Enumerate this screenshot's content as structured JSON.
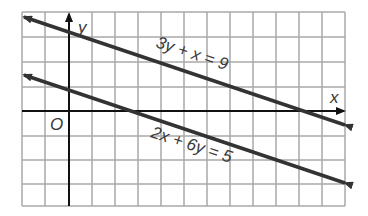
{
  "graph": {
    "type": "coordinate-plane",
    "axis_labels": {
      "x": "x",
      "y": "y",
      "origin": "O"
    },
    "grid": {
      "x_min": -2,
      "x_max": 12,
      "y_min": -4,
      "y_max": 4,
      "cell_px": 23.3
    },
    "lines": [
      {
        "equation": "3y + x = 9",
        "slope": -0.3333,
        "y_intercept": 3
      },
      {
        "equation": "2x + 6y = 5",
        "slope": -0.3333,
        "y_intercept": 0.8333
      }
    ],
    "colors": {
      "grid": "#a8a8a8",
      "axis": "#111111",
      "line": "#333333"
    }
  }
}
